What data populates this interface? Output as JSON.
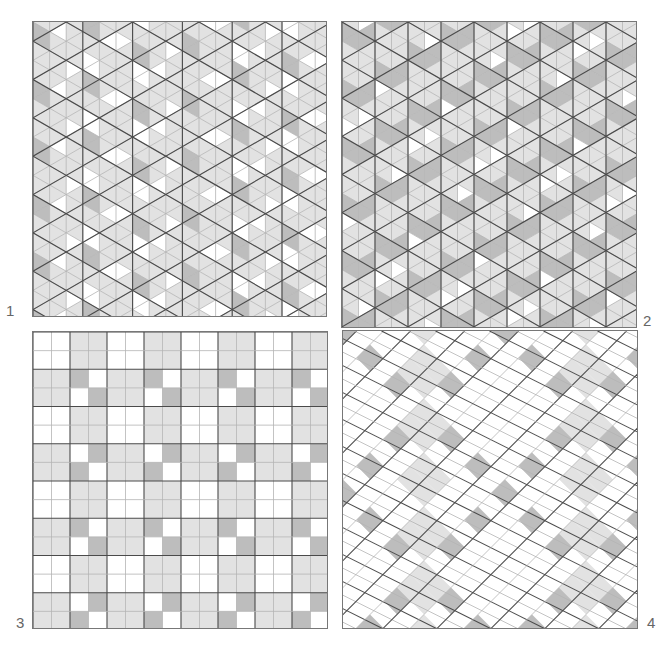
{
  "figure": {
    "colors": {
      "white": "#ffffff",
      "light": "#e2e2e2",
      "dark": "#bdbdbd",
      "major_line": "#4a4a4a",
      "minor_line": "#b4b4b4"
    },
    "panels": [
      {
        "id": 1,
        "label": "1",
        "kind": "triangular-grid-vertical-prisms",
        "x": 32,
        "y": 21,
        "w": 295,
        "h": 296,
        "unit": 16.6
      },
      {
        "id": 2,
        "label": "2",
        "kind": "triangular-grid-diagonal-bands",
        "x": 341,
        "y": 21,
        "w": 296,
        "h": 307,
        "unit": 16.5
      },
      {
        "id": 3,
        "label": "3",
        "kind": "square-grid-checks",
        "x": 32,
        "y": 331,
        "w": 296,
        "h": 298,
        "cols": 16,
        "rows": 16
      },
      {
        "id": 4,
        "label": "4",
        "kind": "diagonal-square-grid",
        "x": 342,
        "y": 330,
        "w": 296,
        "h": 299,
        "unit": 13.5
      }
    ],
    "labels": [
      {
        "text": "1",
        "x": 6,
        "y": 303
      },
      {
        "text": "2",
        "x": 643,
        "y": 313
      },
      {
        "text": "3",
        "x": 16,
        "y": 615
      },
      {
        "text": "4",
        "x": 647,
        "y": 615
      }
    ]
  }
}
